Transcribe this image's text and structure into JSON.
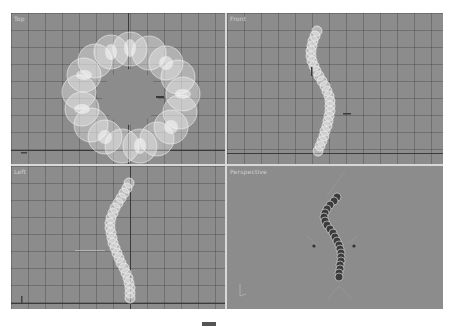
{
  "viewports": [
    {
      "id": "top",
      "label": "Top",
      "object": "torus-of-spheres"
    },
    {
      "id": "front",
      "label": "Front",
      "object": "sphere-chain-s-curve"
    },
    {
      "id": "left",
      "label": "Left",
      "object": "sphere-chain-arc"
    },
    {
      "id": "perspective",
      "label": "Perspective",
      "object": "sphere-chain-shaded"
    }
  ],
  "colors": {
    "viewport_bg": "#8c8c8c",
    "grid": "#5a5a5a",
    "axis": "#3a3a3a",
    "divider": "#d8d8d8",
    "wireframe": "#f2f2f2",
    "shaded": "#3c3c3c"
  },
  "caption": {
    "text": "图 5.32"
  }
}
